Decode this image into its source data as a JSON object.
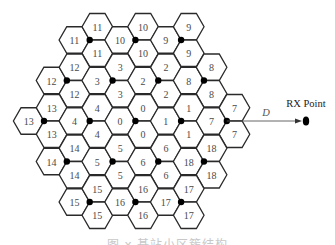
{
  "figure": {
    "clusters": [
      {
        "id": "11",
        "row": 0,
        "col": 1
      },
      {
        "id": "10",
        "row": 0,
        "col": 2
      },
      {
        "id": "9",
        "row": 0,
        "col": 3
      },
      {
        "id": "12",
        "row": 1,
        "col": 0.5
      },
      {
        "id": "3",
        "row": 1,
        "col": 1.5
      },
      {
        "id": "2",
        "row": 1,
        "col": 2.5
      },
      {
        "id": "8",
        "row": 1,
        "col": 3.5
      },
      {
        "id": "13",
        "row": 2,
        "col": 0
      },
      {
        "id": "4",
        "row": 2,
        "col": 1
      },
      {
        "id": "0",
        "row": 2,
        "col": 2
      },
      {
        "id": "1",
        "row": 2,
        "col": 3
      },
      {
        "id": "7",
        "row": 2,
        "col": 4
      },
      {
        "id": "14",
        "row": 3,
        "col": 0.5
      },
      {
        "id": "5",
        "row": 3,
        "col": 1.5
      },
      {
        "id": "6",
        "row": 3,
        "col": 2.5
      },
      {
        "id": "18",
        "row": 3,
        "col": 3.5
      },
      {
        "id": "15",
        "row": 4,
        "col": 1
      },
      {
        "id": "16",
        "row": 4,
        "col": 2
      },
      {
        "id": "17",
        "row": 4,
        "col": 3
      }
    ],
    "sectors_per_cluster": 3,
    "distance_label": "D",
    "rx_label": "RX Point",
    "arrow_from_cluster": "7",
    "colors": {
      "hex_stroke": "#2a2a2a",
      "hex_label": "#4a4a4a",
      "base_station": "#000000",
      "rx_point": "#000000"
    }
  },
  "caption": "图 x  基站小区簇结构"
}
